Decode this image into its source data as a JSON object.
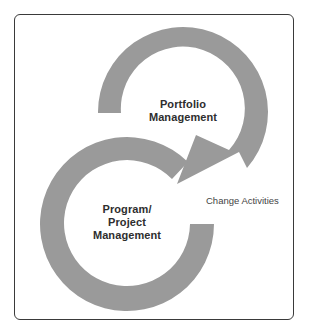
{
  "diagram": {
    "type": "cycle-diagram",
    "colors": {
      "ring": "#9a9a9a",
      "text": "#2e2e2e",
      "frame": "#3a3a3a",
      "background": "#ffffff"
    },
    "nodes": [
      {
        "id": "portfolio",
        "lines": [
          "Portfolio",
          "Management"
        ]
      },
      {
        "id": "program",
        "lines": [
          "Program/",
          "Project",
          "Management"
        ]
      }
    ],
    "edges": [
      {
        "from": "portfolio",
        "to": "program",
        "label": "Change Activities"
      }
    ]
  }
}
